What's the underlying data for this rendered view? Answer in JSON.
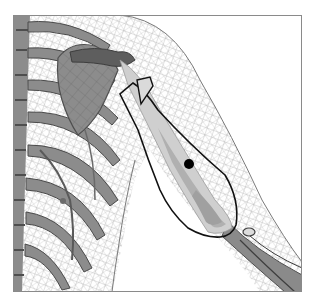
{
  "figure": {
    "frame": {
      "x": 13,
      "y": 15,
      "width": 289,
      "height": 277,
      "stroke": "#8a8a8a"
    },
    "colors": {
      "background": "#ffffff",
      "mesh": "#9a9a9a",
      "bone_fill": "#8c8c8c",
      "bone_dark": "#5a5a5a",
      "bone_light": "#b8b8b8",
      "humerus_fill": "#cfcfcf",
      "muscle_fill": "#bdbdbd",
      "outline": "#111111",
      "marker": "#000000"
    },
    "marker": {
      "cx": 189,
      "cy": 164,
      "r": 5
    },
    "parts": [
      {
        "name": "ribcage"
      },
      {
        "name": "spine"
      },
      {
        "name": "scapula"
      },
      {
        "name": "clavicle"
      },
      {
        "name": "humerus"
      },
      {
        "name": "upper-arm-outline"
      },
      {
        "name": "forearm"
      },
      {
        "name": "skin-wireframe-mesh"
      }
    ]
  }
}
